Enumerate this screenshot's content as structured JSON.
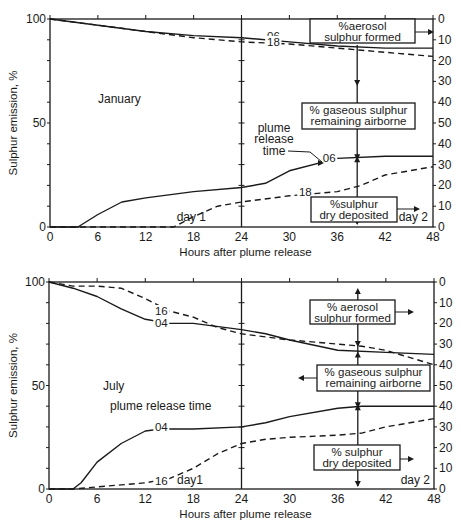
{
  "colors": {
    "ink": "#1a1a1a",
    "background": "#ffffff"
  },
  "chart_data": [
    {
      "type": "line",
      "title": "January",
      "panel": "top",
      "xlabel": "Hours after plume release",
      "ylabel": "Sulphur emission, %",
      "xlim": [
        0,
        48
      ],
      "ylim": [
        0,
        100
      ],
      "xticks": [
        0,
        6,
        12,
        18,
        24,
        30,
        36,
        42,
        48
      ],
      "yticks_left": [
        0,
        50,
        100
      ],
      "yticks_right": [
        0,
        10,
        20,
        30,
        40,
        50,
        40,
        30,
        20,
        10,
        0
      ],
      "right_axis_note": "Right axis reads 0 at top up to 50 mid then back down to 0 at bottom",
      "day_divider_x": 24,
      "day_labels": [
        "day 1",
        "day 2"
      ],
      "annotation_line_x": 38.5,
      "annotation_text": "plume release time",
      "boxes": [
        {
          "text": [
            "%aerosol",
            "sulphur formed"
          ]
        },
        {
          "text": [
            "% gaseous sulphur",
            "remaining airborne"
          ]
        },
        {
          "text": [
            "%sulphur",
            "dry deposited"
          ]
        }
      ],
      "series": [
        {
          "name": "06",
          "group": "remaining (top curves)",
          "style": "solid",
          "x": [
            0,
            6,
            12,
            18,
            24,
            30,
            36,
            42,
            48
          ],
          "y": [
            100,
            97,
            94,
            92,
            91,
            89,
            87,
            86,
            86
          ]
        },
        {
          "name": "18",
          "group": "remaining (top curves)",
          "style": "dashed",
          "x": [
            0,
            6,
            12,
            18,
            24,
            30,
            36,
            42,
            48
          ],
          "y": [
            100,
            97,
            94,
            91,
            89,
            88,
            86,
            84,
            82
          ]
        },
        {
          "name": "06",
          "group": "deposited (bottom curves)",
          "style": "solid",
          "x": [
            0,
            3.5,
            6,
            9,
            12,
            18,
            24,
            27,
            30,
            36,
            42,
            48
          ],
          "y": [
            0,
            0,
            6,
            12,
            14,
            17,
            19,
            21,
            27,
            33,
            34,
            34
          ]
        },
        {
          "name": "18",
          "group": "deposited (bottom curves)",
          "style": "dashed",
          "x": [
            0,
            15.5,
            18,
            21,
            24,
            30,
            36,
            39,
            42,
            48
          ],
          "y": [
            0,
            0,
            5,
            10,
            12,
            15,
            17,
            20,
            25,
            29
          ]
        }
      ]
    },
    {
      "type": "line",
      "title": "July",
      "panel": "bottom",
      "xlabel": "Hours after plume release",
      "ylabel": "Sulphur emission, %",
      "xlim": [
        0,
        48
      ],
      "ylim": [
        0,
        100
      ],
      "xticks": [
        0,
        6,
        12,
        18,
        24,
        30,
        36,
        42,
        48
      ],
      "yticks_left": [
        0,
        50,
        100
      ],
      "yticks_right": [
        0,
        10,
        20,
        30,
        40,
        50,
        40,
        30,
        20,
        10,
        0
      ],
      "day_divider_x": 24,
      "day_labels": [
        "day1",
        "day 2"
      ],
      "annotation_line_x": 38.5,
      "annotation_text": "plume release time",
      "boxes": [
        {
          "text": [
            "% aerosol",
            "sulphur formed"
          ]
        },
        {
          "text": [
            "% gaseous sulphur",
            "remaining airborne"
          ]
        },
        {
          "text": [
            "% sulphur",
            "dry deposited"
          ]
        }
      ],
      "series": [
        {
          "name": "04",
          "group": "remaining (top curves)",
          "style": "solid",
          "x": [
            0,
            3,
            6,
            9,
            12,
            15,
            18,
            24,
            27,
            30,
            36,
            42,
            48
          ],
          "y": [
            100,
            97,
            93,
            87,
            82,
            80,
            80,
            77,
            75,
            72,
            67,
            66,
            65
          ]
        },
        {
          "name": "16",
          "group": "remaining (top curves)",
          "style": "dashed",
          "x": [
            0,
            3,
            6,
            9,
            12,
            15,
            18,
            21,
            24,
            30,
            36,
            39,
            42,
            48
          ],
          "y": [
            100,
            98,
            98,
            97,
            92,
            86,
            83,
            78,
            75,
            72,
            70,
            69,
            67,
            60
          ]
        },
        {
          "name": "04",
          "group": "deposited (bottom curves)",
          "style": "solid",
          "x": [
            0,
            3,
            4,
            6,
            9,
            12,
            14,
            18,
            24,
            27,
            30,
            36,
            39,
            42,
            48
          ],
          "y": [
            0,
            0,
            3,
            13,
            22,
            28,
            29,
            29,
            30,
            32,
            35,
            39,
            40,
            40,
            40
          ]
        },
        {
          "name": "16",
          "group": "deposited (bottom curves)",
          "style": "dashed",
          "x": [
            0,
            3,
            6,
            9,
            12,
            15,
            18,
            21,
            24,
            27,
            30,
            36,
            39,
            42,
            48
          ],
          "y": [
            0,
            0,
            1,
            2,
            3,
            5,
            10,
            17,
            22,
            24,
            25,
            26,
            27,
            30,
            34
          ]
        }
      ]
    }
  ]
}
